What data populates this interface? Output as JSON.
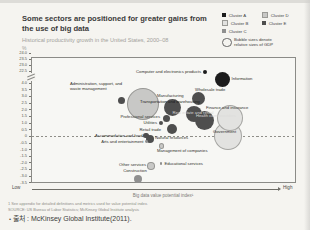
{
  "slide": {
    "title_line1": "Some sectors are positioned for greater gains from",
    "title_line2": "the use of big data",
    "subtitle": "Historical productivity growth in the United States, 2000–08",
    "y_unit": "%",
    "legend": {
      "clusters": [
        {
          "label": "Cluster A",
          "color": "#1c1c1c"
        },
        {
          "label": "Cluster D",
          "color": "#c8c8c6"
        },
        {
          "label": "Cluster B",
          "color": "#e2e2e0"
        },
        {
          "label": "Cluster E",
          "color": "#4e4e4e"
        },
        {
          "label": "Cluster C",
          "color": "#8f8f8f"
        }
      ],
      "bubble_note": "Bubble sizes denote\nrelative sizes of GDP"
    },
    "x_axis_low": "Low",
    "x_axis_high": "High",
    "x_axis_title": "Big data value potential index¹",
    "footnote": "1  See appendix for detailed definitions and metrics used for value potential index.",
    "source": "SOURCE:  US Bureau of Labor Statistics; McKinsey Global Institute analysis",
    "caption_bullet": "•",
    "caption": "출처 : McKinsey Global Institute(2011)."
  },
  "chart_data": {
    "type": "scatter",
    "title": "Some sectors are positioned for greater gains from the use of big data",
    "ylabel": "Historical productivity growth in the United States, 2000–08 (%)",
    "xlabel": "Big data value potential index (Low → High)",
    "legend_position": "top-right",
    "y_axis_break": true,
    "y_ticks_upper": [
      "24.0",
      "23.5",
      "23.0",
      "22.5"
    ],
    "y_ticks_lower": [
      "4.0",
      "3.5",
      "3.0",
      "2.5",
      "2.0",
      "1.5",
      "1.0",
      "0.5",
      "0",
      "-0.5",
      "-1.0",
      "-1.5",
      "-2.0",
      "-2.5",
      "-3.0",
      "-3.5"
    ],
    "zero_line": "dashed",
    "bubble_size_meaning": "relative size of GDP",
    "cluster_colors": {
      "A": "#1c1c1c",
      "B": "#e2e2e0",
      "C": "#8f8f8f",
      "D": "#c8c8c6",
      "E": "#4e4e4e"
    },
    "sectors": [
      {
        "label": "Computer and electronics products",
        "cluster": "A",
        "x_index": 66,
        "productivity_growth": 22.5,
        "bubble": {
          "x": 205,
          "y": 72,
          "r": 2.2
        },
        "lbl": {
          "x": 201,
          "y": 72,
          "align": "right"
        }
      },
      {
        "label": "Information",
        "cluster": "A",
        "x_index": 72,
        "productivity_growth": 5.0,
        "bubble": {
          "x": 222,
          "y": 79,
          "r": 7.5
        },
        "lbl": {
          "x": 231.5,
          "y": 79,
          "align": "left"
        }
      },
      {
        "label": "Administration, support, and\nwaste management",
        "cluster": "E",
        "x_index": 34,
        "productivity_growth": 2.75,
        "bubble": {
          "x": 121,
          "y": 100,
          "r": 3.5
        },
        "lbl": {
          "x": 70,
          "y": 87,
          "align": "left"
        }
      },
      {
        "label": "Wholesale trade",
        "cluster": "E",
        "x_index": 63,
        "productivity_growth": 2.9,
        "bubble": {
          "x": 198,
          "y": 98,
          "r": 6.5
        },
        "lbl": {
          "x": 195,
          "y": 90,
          "align": "left"
        }
      },
      {
        "label": "Manufacturing",
        "cluster": "D",
        "x_index": 42,
        "productivity_growth": 2.5,
        "bubble": {
          "x": 142,
          "y": 103,
          "r": 15
        },
        "lbl": {
          "x": 157,
          "y": 95.5,
          "align": "left"
        }
      },
      {
        "label": "Transportation and warehousing",
        "cluster": "E",
        "x_index": 53,
        "productivity_growth": 2.2,
        "bubble": {
          "x": 172,
          "y": 107,
          "r": 8.5
        },
        "lbl": {
          "x": 170,
          "y": 101.5,
          "align": "center",
          "color": "#1d1d1d"
        }
      },
      {
        "label": "Professional services",
        "cluster": "E",
        "x_index": 51,
        "productivity_growth": 1.4,
        "bubble": {
          "x": 166,
          "y": 118,
          "r": 3.5
        },
        "lbl": {
          "x": 160,
          "y": 117,
          "align": "right"
        }
      },
      {
        "label": "Real estate and rental",
        "cluster": "E",
        "x_index": 62,
        "productivity_growth": 1.7,
        "bubble": {
          "x": 194,
          "y": 114,
          "r": 8
        },
        "lbl": {
          "x": 193,
          "y": 113,
          "align": "center",
          "color": "#d8d8d6"
        }
      },
      {
        "label": "Finance and insurance",
        "cluster": "B",
        "x_index": 75,
        "productivity_growth": 1.5,
        "bubble": {
          "x": 229,
          "y": 117,
          "r": 12
        },
        "lbl": {
          "x": 206,
          "y": 107.5,
          "align": "left"
        }
      },
      {
        "label": "Utilities",
        "cluster": "E",
        "x_index": 49,
        "productivity_growth": 1.0,
        "bubble": {
          "x": 161,
          "y": 123,
          "r": 2.3
        },
        "lbl": {
          "x": 157,
          "y": 123,
          "align": "right"
        }
      },
      {
        "label": "Retail trade",
        "cluster": "E",
        "x_index": 53,
        "productivity_growth": 0.6,
        "bubble": {
          "x": 172,
          "y": 129,
          "r": 5
        },
        "lbl": {
          "x": 161,
          "y": 130,
          "align": "right"
        }
      },
      {
        "label": "Health care providers",
        "cluster": "E",
        "x_index": 65,
        "productivity_growth": 1.25,
        "bubble": {
          "x": 204,
          "y": 120,
          "r": 9.5
        },
        "lbl": {
          "x": 196,
          "y": 115.5,
          "align": "left",
          "color": "#dddddb"
        }
      },
      {
        "label": "Government",
        "cluster": "B",
        "x_index": 74,
        "productivity_growth": 0.1,
        "bubble": {
          "x": 227,
          "y": 135,
          "r": 13
        },
        "lbl": {
          "x": 213,
          "y": 131.5,
          "align": "left"
        }
      },
      {
        "label": "Accommodation and food",
        "cluster": "E",
        "x_index": 43,
        "productivity_growth": 0.1,
        "bubble": {
          "x": 146,
          "y": 135.5,
          "r": 2.6
        },
        "lbl": {
          "x": 142.5,
          "y": 135.5,
          "align": "right"
        }
      },
      {
        "label": "Natural resources",
        "cluster": "E",
        "x_index": 45,
        "productivity_growth": -0.2,
        "bubble": {
          "x": 150,
          "y": 139,
          "r": 4
        },
        "lbl": {
          "x": 155,
          "y": 137.5,
          "align": "left"
        }
      },
      {
        "label": "Arts and entertainment",
        "cluster": "C",
        "x_index": 43,
        "productivity_growth": -0.25,
        "bubble": {
          "x": 146.5,
          "y": 141.5,
          "r": 1.4
        },
        "lbl": {
          "x": 143.5,
          "y": 141.5,
          "align": "right"
        }
      },
      {
        "label": "Management of companies",
        "cluster": "D",
        "x_index": 49,
        "productivity_growth": -0.6,
        "bubble": {
          "x": 160.5,
          "y": 145,
          "r": 1.9
        },
        "lbl": {
          "x": 157,
          "y": 150.5,
          "align": "left"
        }
      },
      {
        "label": "Other services",
        "cluster": "D",
        "x_index": 45,
        "productivity_growth": -2.1,
        "bubble": {
          "x": 150,
          "y": 165,
          "r": 2.8
        },
        "lbl": {
          "x": 146,
          "y": 165,
          "align": "right"
        }
      },
      {
        "label": "Educational services",
        "cluster": "C",
        "x_index": 49,
        "productivity_growth": -2.0,
        "bubble": {
          "x": 161,
          "y": 163.5,
          "r": 1.3
        },
        "lbl": {
          "x": 164.5,
          "y": 163.5,
          "align": "left"
        }
      },
      {
        "label": "Construction",
        "cluster": "C",
        "x_index": 40,
        "productivity_growth": -3.2,
        "bubble": {
          "x": 138,
          "y": 179,
          "r": 4.2
        },
        "lbl": {
          "x": 135,
          "y": 171,
          "align": "center"
        }
      }
    ]
  },
  "layout_values": {
    "yticks_upper_start": 53,
    "yticks_upper_step": 6,
    "yticks_lower_start": 83,
    "yticks_lower_step": 6.65
  }
}
